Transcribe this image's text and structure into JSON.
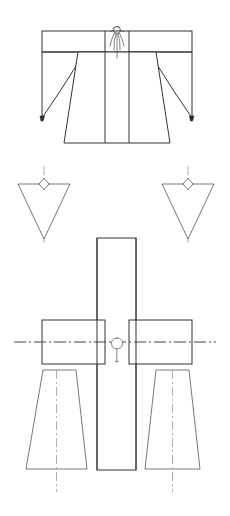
{
  "page": {
    "title": "Garment Technical Line Drawing",
    "background_color": "#ffffff",
    "width": 230,
    "height": 516,
    "line_color": "#333333",
    "centerline_color": "#9a9a9a"
  },
  "figures": [
    {
      "id": "kimono-front-view",
      "name": "Kimono Front View",
      "description": "Flared wide-sleeve robe with horizontal shoulder yoke band, two vertical centre-front panel seams, angled sleeve underarm lines terminating in small tie knots, and a flared hem.",
      "parts": [
        {
          "name": "shoulder-yoke-band",
          "type": "rectangle"
        },
        {
          "name": "left-sleeve",
          "type": "polygon"
        },
        {
          "name": "right-sleeve",
          "type": "polygon"
        },
        {
          "name": "body-panel",
          "type": "flared-polygon"
        },
        {
          "name": "centre-front-seam-left",
          "type": "line"
        },
        {
          "name": "centre-front-seam-right",
          "type": "line"
        },
        {
          "name": "neckline-collar-tie",
          "type": "sketch-detail"
        },
        {
          "name": "left-sleeve-tie-knot",
          "type": "knot"
        },
        {
          "name": "right-sleeve-tie-knot",
          "type": "knot"
        }
      ]
    },
    {
      "id": "triangle-pair",
      "name": "Inverted Triangle Pair",
      "description": "Two identical inverted (point-down) triangles, each with a small diamond marker centred on the top edge and a vertical dash-dot centreline running through the apex.",
      "parts": [
        {
          "name": "left-inverted-triangle",
          "type": "triangle"
        },
        {
          "name": "left-diamond-marker",
          "type": "diamond"
        },
        {
          "name": "left-centerline",
          "type": "dash-dot-line"
        },
        {
          "name": "right-inverted-triangle",
          "type": "triangle"
        },
        {
          "name": "right-diamond-marker",
          "type": "diamond"
        },
        {
          "name": "right-centerline",
          "type": "dash-dot-line"
        }
      ]
    },
    {
      "id": "cross-assembly",
      "name": "Cross Assembly with Trapezoids",
      "description": "A tall central vertical rectangle crossed by two horizontal side rectangles forming a cross; a small loop-and-tail hanging detail marks the crossing centre; a horizontal dash-dot axis passes through both side rectangles; two flared trapezoids (narrow top, wide bottom) hang below, each with a vertical dash-dot centreline.",
      "parts": [
        {
          "name": "central-vertical-rectangle",
          "type": "rectangle"
        },
        {
          "name": "left-horizontal-rectangle",
          "type": "rectangle"
        },
        {
          "name": "right-horizontal-rectangle",
          "type": "rectangle"
        },
        {
          "name": "horizontal-axis-centerline",
          "type": "dash-dot-line"
        },
        {
          "name": "centre-loop-detail",
          "type": "loop-and-tail"
        },
        {
          "name": "left-trapezoid",
          "type": "trapezoid"
        },
        {
          "name": "left-trapezoid-centerline",
          "type": "dash-dot-line"
        },
        {
          "name": "right-trapezoid",
          "type": "trapezoid"
        },
        {
          "name": "right-trapezoid-centerline",
          "type": "dash-dot-line"
        }
      ]
    }
  ]
}
